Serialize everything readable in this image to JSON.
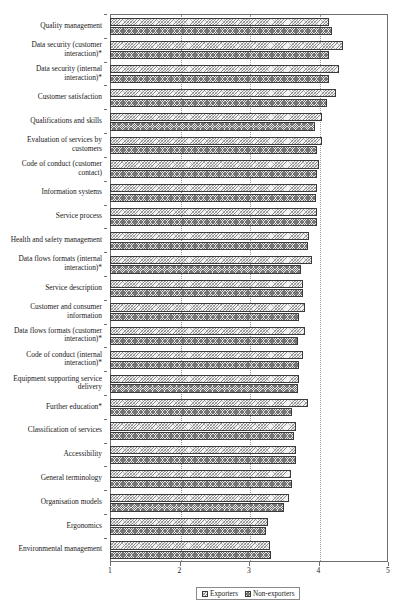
{
  "chart_data": {
    "type": "bar",
    "orientation": "horizontal",
    "title": "",
    "xlabel": "",
    "ylabel": "",
    "xlim": [
      1,
      5
    ],
    "xticks": [
      1,
      2,
      3,
      4,
      5
    ],
    "xtick_labels": [
      "1",
      "2",
      "3",
      "4",
      "5"
    ],
    "grid": true,
    "grid_axis": "x",
    "legend_position": "bottom",
    "categories": [
      "Quality management",
      "Data security (customer interaction)*",
      "Data security (internal interaction)*",
      "Customer satisfaction",
      "Qualifications and skills",
      "Evaluation of services by customers",
      "Code of conduct (customer contact)",
      "Information systems",
      "Service process",
      "Health and safety management",
      "Data flows formats (internal interaction)*",
      "Service description",
      "Customer and consumer information",
      "Data flows formats (customer interaction)*",
      "Code of conduct (internal interaction)*",
      "Equipment supporting service delivery",
      "Further education*",
      "Classification of services",
      "Accessibility",
      "General terminology",
      "Organisation models",
      "Ergonomics",
      "Environmental management"
    ],
    "series": [
      {
        "name": "Exporters",
        "values": [
          4.15,
          4.35,
          4.3,
          4.25,
          4.05,
          4.05,
          4.0,
          3.98,
          3.98,
          3.87,
          3.9,
          3.78,
          3.8,
          3.8,
          3.78,
          3.72,
          3.85,
          3.68,
          3.67,
          3.6,
          3.58,
          3.28,
          3.3
        ]
      },
      {
        "name": "Non-exporters",
        "values": [
          4.2,
          4.15,
          4.15,
          4.12,
          3.95,
          3.98,
          3.98,
          3.97,
          3.98,
          3.85,
          3.75,
          3.78,
          3.72,
          3.7,
          3.72,
          3.7,
          3.62,
          3.65,
          3.67,
          3.62,
          3.5,
          3.25,
          3.32
        ]
      }
    ]
  },
  "legend": {
    "items": [
      {
        "label": "Exporters",
        "swatch": "exporters-swatch"
      },
      {
        "label": "Non-exporters",
        "swatch": "nonexporters-swatch"
      }
    ]
  }
}
